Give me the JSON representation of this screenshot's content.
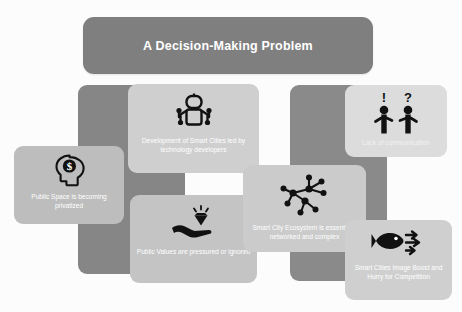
{
  "title": {
    "text": "A Decision-Making Problem"
  },
  "cards": [
    {
      "id": "public-space",
      "label": "Public Space is becoming privatized",
      "icon": "head-dollar-icon"
    },
    {
      "id": "development",
      "label": "Development of Smart Cities led by technology developers",
      "icon": "robot-icon"
    },
    {
      "id": "public-values",
      "label": "Public Values are pressured or ignored",
      "icon": "hand-diamond-icon"
    },
    {
      "id": "lack-of-communication",
      "label": "Lack of communication",
      "icon": "two-people-exclamation-question-icon"
    },
    {
      "id": "ecosystem",
      "label": "Smart City Ecosystem is essentially networked and complex",
      "icon": "network-nodes-icon"
    },
    {
      "id": "competition",
      "label": "Smart Cities Image Boost and Hurry for Competition",
      "icon": "fish-arrows-icon"
    }
  ],
  "colors": {
    "title_banner": "#807f7f",
    "panel": "#8a8a8a",
    "card": "#cbcbcb",
    "text": "#ffffff",
    "icon": "#111111",
    "background": "#fcfcfc"
  }
}
